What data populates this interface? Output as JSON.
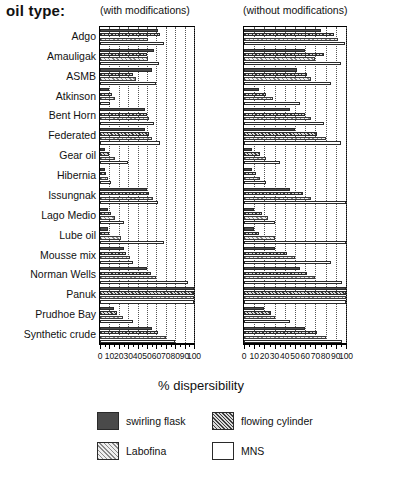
{
  "header": {
    "oil_type_label": "oil type:",
    "left_panel_caption": "(with modifications)",
    "right_panel_caption": "(without modifications)"
  },
  "axis_title": "% dispersibility",
  "legend": {
    "items": [
      {
        "label": "swirling flask",
        "swatch": "solid-dark",
        "color": "#4a4a4a"
      },
      {
        "label": "flowing cylinder",
        "swatch": "cross-hatch",
        "color": "#3d3d3d"
      },
      {
        "label": "Labofina",
        "swatch": "light-hatch",
        "color": "#8a8a8a"
      },
      {
        "label": "MNS",
        "swatch": "white",
        "color": "#ffffff"
      }
    ]
  },
  "chart_data": {
    "type": "bar",
    "orientation": "horizontal",
    "title": "",
    "subtitle": "",
    "xlabel": "% dispersibility",
    "ylabel": "oil type:",
    "xlim": [
      0,
      100
    ],
    "xticks": [
      0,
      10,
      20,
      30,
      40,
      50,
      60,
      70,
      80,
      90,
      100
    ],
    "xticklabels": [
      "0",
      "10",
      "20",
      "30",
      "40",
      "50",
      "60",
      "70",
      "80",
      "90",
      "100"
    ],
    "grid": "vertical-dotted",
    "legend_position": "bottom",
    "categories": [
      "Adgo",
      "Amauligak",
      "ASMB",
      "Atkinson",
      "Bent Horn",
      "Federated",
      "Gear oil",
      "Hibernia",
      "Issungnak",
      "Lago Medio",
      "Lube oil",
      "Mousse mix",
      "Norman Wells",
      "Panuk",
      "Prudhoe Bay",
      "Synthetic crude"
    ],
    "series_names": [
      "swirling flask",
      "flowing cylinder",
      "Labofina",
      "MNS"
    ],
    "panels": [
      {
        "name": "with modifications",
        "series": [
          {
            "name": "swirling flask",
            "values": [
              62,
              57,
              55,
              10,
              48,
              48,
              5,
              5,
              50,
              8,
              8,
              25,
              50,
              100,
              15,
              55
            ]
          },
          {
            "name": "flowing cylinder",
            "values": [
              64,
              50,
              35,
              13,
              50,
              52,
              10,
              6,
              52,
              12,
              10,
              28,
              54,
              100,
              18,
              62
            ]
          },
          {
            "name": "Labofina",
            "values": [
              51,
              51,
              38,
              16,
              52,
              55,
              16,
              8,
              56,
              16,
              22,
              32,
              60,
              100,
              24,
              70
            ]
          },
          {
            "name": "MNS",
            "values": [
              68,
              63,
              60,
              11,
              57,
              64,
              30,
              12,
              62,
              25,
              68,
              35,
              94,
              100,
              35,
              80
            ]
          }
        ]
      },
      {
        "name": "without modifications",
        "series": [
          {
            "name": "swirling flask",
            "values": [
              75,
              60,
              52,
              15,
              45,
              50,
              8,
              8,
              45,
              10,
              10,
              30,
              55,
              100,
              20,
              60
            ]
          },
          {
            "name": "flowing cylinder",
            "values": [
              88,
              78,
              62,
              22,
              60,
              72,
              16,
              12,
              58,
              18,
              15,
              42,
              62,
              100,
              26,
              72
            ]
          },
          {
            "name": "Labofina",
            "values": [
              92,
              70,
              66,
              28,
              66,
              80,
              22,
              16,
              66,
              24,
              30,
              50,
              70,
              100,
              30,
              80
            ]
          },
          {
            "name": "MNS",
            "values": [
              99,
              95,
              85,
              55,
              78,
              95,
              35,
              22,
              100,
              30,
              100,
              85,
              96,
              100,
              45,
              96
            ]
          }
        ]
      }
    ]
  }
}
